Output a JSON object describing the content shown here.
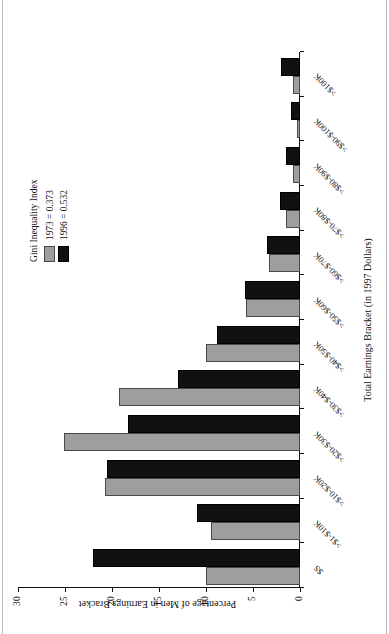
{
  "chart_data": {
    "type": "bar",
    "orientation": "vertical-grouped",
    "title": "",
    "xlabel": "Total Earnings Bracket (in 1997 Dollars)",
    "ylabel": "Percentage of Men in Earnings Bracket",
    "ylim": [
      0,
      30
    ],
    "yticks": [
      0,
      5,
      10,
      15,
      20,
      25,
      30
    ],
    "ytick_labels": [
      "0",
      "5",
      "10",
      "15",
      "20",
      "25",
      "30"
    ],
    "grid": false,
    "legend_position": "upper-right",
    "legend_title": "Gini Inequality Index",
    "categories": [
      "$S",
      ">$1-$10K",
      ">$10-$20K",
      ">$20-$30K",
      ">$30-$40K",
      ">$40-$50K",
      ">$50-$60K",
      ">$60-$70K",
      ">$70-$80K",
      ">$80-$90K",
      ">$90-$100K",
      ">$100K"
    ],
    "series": [
      {
        "name": "1973 = 0.373",
        "short_name": "1973",
        "color": "#9e9e9e",
        "values": [
          10.0,
          9.5,
          20.7,
          25.1,
          19.3,
          10.0,
          5.7,
          3.3,
          1.5,
          0.7,
          0.3,
          0.7
        ]
      },
      {
        "name": "1996 = 0.532",
        "short_name": "1996",
        "color": "#111111",
        "values": [
          22.0,
          11.0,
          20.5,
          18.3,
          13.0,
          8.8,
          5.8,
          3.5,
          2.1,
          1.5,
          1.0,
          2.0
        ]
      }
    ]
  },
  "legend": {
    "title": "Gini Inequality Index",
    "entries": [
      {
        "label": "1973 = 0.373",
        "color": "#9e9e9e"
      },
      {
        "label": "1996 = 0.532",
        "color": "#111111"
      }
    ]
  },
  "axes": {
    "x_title": "Total Earnings Bracket (in 1997 Dollars)",
    "y_title": "Percentage of Men in Earnings Bracket"
  },
  "colors": {
    "series_1973": "#9e9e9e",
    "series_1996": "#111111",
    "axis": "#111111",
    "background": "#ffffff",
    "page_rule": "#b9b9b9"
  }
}
